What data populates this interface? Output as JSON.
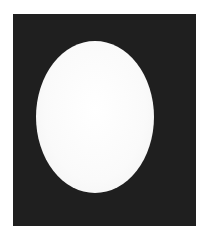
{
  "image": {
    "description": "White oval (egg-like) on a dark square background",
    "colors": {
      "background": "#ffffff",
      "frame": "#1f1f1f",
      "oval": "#fafafa"
    },
    "watermark_text": ""
  }
}
